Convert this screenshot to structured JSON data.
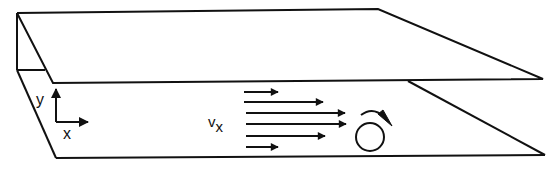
{
  "diagram": {
    "type": "parallel-plate shear flow schematic",
    "stroke_color": "#111111",
    "background": "#ffffff",
    "labels": {
      "axis_y": "y",
      "axis_x": "x",
      "velocity_symbol": "v",
      "velocity_subscript": "x"
    },
    "elements": {
      "top_plate": "upper plate (moving)",
      "bottom_plate": "lower plate (stationary)",
      "velocity_profile": "six arrows showing parabolic velocity profile",
      "vortex": "circle with clockwise rotation arrow"
    },
    "velocity_arrows": [
      {
        "y": 92,
        "x1": 244,
        "x2": 278
      },
      {
        "y": 102,
        "x1": 244,
        "x2": 323
      },
      {
        "y": 113,
        "x1": 246,
        "x2": 345
      },
      {
        "y": 124,
        "x1": 246,
        "x2": 346
      },
      {
        "y": 136,
        "x1": 246,
        "x2": 325
      },
      {
        "y": 147,
        "x1": 246,
        "x2": 278
      }
    ]
  }
}
